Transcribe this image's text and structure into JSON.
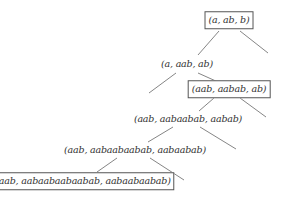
{
  "diagram": {
    "type": "tree",
    "nodes": [
      {
        "id": "n0",
        "label": "(a, ab, b)",
        "boxed": true,
        "x": 229,
        "y": 20
      },
      {
        "id": "n1",
        "label": "(a, aab, ab)",
        "boxed": false,
        "x": 187,
        "y": 64
      },
      {
        "id": "n2",
        "label": "(aab, aabab, ab)",
        "boxed": true,
        "x": 229,
        "y": 89
      },
      {
        "id": "n3",
        "label": "(aab, aabaabab, aabab)",
        "boxed": false,
        "x": 188,
        "y": 119
      },
      {
        "id": "n4",
        "label": "(aab, aabaabaabab, aabaabab)",
        "boxed": false,
        "x": 135,
        "y": 150
      },
      {
        "id": "n5",
        "label": "(aab, aabaabaabaabab, aabaabaabab)",
        "boxed": true,
        "x": 83,
        "y": 181
      }
    ],
    "edges": [
      {
        "from": "n0",
        "to": "n1",
        "x1": 219,
        "y1": 31,
        "x2": 198,
        "y2": 55
      },
      {
        "from": "n0",
        "to": "right-leaf-0",
        "x1": 240,
        "y1": 31,
        "x2": 268,
        "y2": 53
      },
      {
        "from": "n1",
        "to": "left-leaf-1",
        "x1": 176,
        "y1": 73,
        "x2": 149,
        "y2": 93
      },
      {
        "from": "n1",
        "to": "n2",
        "x1": 198,
        "y1": 73,
        "x2": 218,
        "y2": 82
      },
      {
        "from": "n2",
        "to": "n3",
        "x1": 214,
        "y1": 98,
        "x2": 199,
        "y2": 111
      },
      {
        "from": "n2",
        "to": "right-leaf-2",
        "x1": 240,
        "y1": 98,
        "x2": 266,
        "y2": 117
      },
      {
        "from": "n3",
        "to": "n4",
        "x1": 173,
        "y1": 127,
        "x2": 148,
        "y2": 142
      },
      {
        "from": "n3",
        "to": "right-leaf-3",
        "x1": 200,
        "y1": 127,
        "x2": 236,
        "y2": 149
      },
      {
        "from": "n4",
        "to": "n5",
        "x1": 117,
        "y1": 158,
        "x2": 97,
        "y2": 172
      },
      {
        "from": "n4",
        "to": "right-leaf-4",
        "x1": 150,
        "y1": 158,
        "x2": 184,
        "y2": 180
      }
    ],
    "colors": {
      "edge": "#777777",
      "text": "#333333",
      "box_border": "#555555"
    }
  }
}
